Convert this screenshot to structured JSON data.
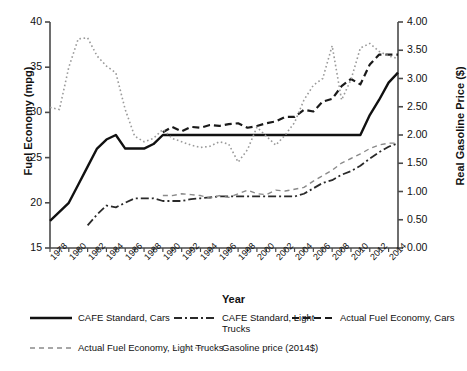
{
  "chart_data": {
    "type": "line",
    "title": "",
    "xlabel": "Year",
    "ylabel": "Fuel Economy (mpg)",
    "ylabel_right": "Real Gasoline Price ($)",
    "grid": false,
    "legend_position": "below",
    "xlim": [
      1978,
      2015
    ],
    "ylim": [
      15,
      40
    ],
    "ylim_right": [
      0.0,
      4.0
    ],
    "yticks": [
      "15",
      "20",
      "25",
      "30",
      "35",
      "40"
    ],
    "yticks_right": [
      "0.00",
      "0.50",
      "1.00",
      "1.50",
      "2.00",
      "2.50",
      "3.00",
      "3.50",
      "4.00"
    ],
    "xticks": [
      "1978",
      "1980",
      "1982",
      "1984",
      "1986",
      "1988",
      "1990",
      "1992",
      "1994",
      "1996",
      "1998",
      "2000",
      "2002",
      "2004",
      "2006",
      "2008",
      "2010",
      "2012",
      "2014"
    ],
    "x": [
      1978,
      1979,
      1980,
      1981,
      1982,
      1983,
      1984,
      1985,
      1986,
      1987,
      1988,
      1989,
      1990,
      1991,
      1992,
      1993,
      1994,
      1995,
      1996,
      1997,
      1998,
      1999,
      2000,
      2001,
      2002,
      2003,
      2004,
      2005,
      2006,
      2007,
      2008,
      2009,
      2010,
      2011,
      2012,
      2013,
      2014,
      2015
    ],
    "series": [
      {
        "name": "CAFE Standard, Cars",
        "axis": "left",
        "style": "solid",
        "values": [
          18.0,
          19.0,
          20.0,
          22.0,
          24.0,
          26.0,
          27.0,
          27.5,
          26.0,
          26.0,
          26.0,
          26.5,
          27.5,
          27.5,
          27.5,
          27.5,
          27.5,
          27.5,
          27.5,
          27.5,
          27.5,
          27.5,
          27.5,
          27.5,
          27.5,
          27.5,
          27.5,
          27.5,
          27.5,
          27.5,
          27.5,
          27.5,
          27.5,
          27.5,
          29.7,
          31.4,
          33.3,
          34.4
        ]
      },
      {
        "name": "CAFE Standard, Light Trucks",
        "axis": "left",
        "style": "dash-dot",
        "values": [
          null,
          null,
          null,
          null,
          17.5,
          18.7,
          19.7,
          19.5,
          20.0,
          20.5,
          20.5,
          20.5,
          20.2,
          20.2,
          20.2,
          20.4,
          20.5,
          20.6,
          20.7,
          20.7,
          20.7,
          20.7,
          20.7,
          20.7,
          20.7,
          20.7,
          20.7,
          21.0,
          21.6,
          22.2,
          22.5,
          23.1,
          23.5,
          24.1,
          24.9,
          25.6,
          26.2,
          26.6
        ]
      },
      {
        "name": "Actual Fuel Economy, Cars",
        "axis": "left",
        "style": "dash",
        "values": [
          null,
          null,
          null,
          null,
          null,
          null,
          null,
          null,
          null,
          null,
          null,
          null,
          27.8,
          28.4,
          27.9,
          28.4,
          28.3,
          28.6,
          28.5,
          28.7,
          28.8,
          28.3,
          28.5,
          28.8,
          29.0,
          29.5,
          29.5,
          30.3,
          30.1,
          31.2,
          31.5,
          32.9,
          33.7,
          33.1,
          35.3,
          36.4,
          36.4,
          36.4
        ]
      },
      {
        "name": "Actual Fuel Economy, Light Trucks",
        "axis": "left",
        "style": "fine-dash",
        "values": [
          null,
          null,
          null,
          null,
          null,
          null,
          null,
          null,
          null,
          null,
          null,
          null,
          20.8,
          20.8,
          21.0,
          20.9,
          20.8,
          20.5,
          20.8,
          20.6,
          21.0,
          21.4,
          21.0,
          20.9,
          21.4,
          21.3,
          21.5,
          21.7,
          22.4,
          23.0,
          23.6,
          24.4,
          24.9,
          25.4,
          26.0,
          26.4,
          26.6,
          26.6
        ]
      },
      {
        "name": "Gasoline price (2014$)",
        "axis": "right",
        "style": "dotted",
        "values": [
          2.49,
          2.45,
          3.2,
          3.7,
          3.72,
          3.4,
          3.22,
          3.1,
          2.45,
          1.98,
          1.88,
          1.94,
          2.1,
          1.94,
          1.88,
          1.82,
          1.78,
          1.8,
          1.88,
          1.84,
          1.52,
          1.74,
          2.14,
          1.98,
          1.82,
          2.0,
          2.22,
          2.62,
          2.88,
          3.0,
          3.58,
          2.62,
          2.98,
          3.54,
          3.62,
          3.48,
          3.4,
          3.35
        ]
      }
    ],
    "legend": [
      {
        "label": "CAFE Standard, Cars",
        "style": "solid"
      },
      {
        "label": "CAFE Standard, Light Trucks",
        "style": "dash-dot"
      },
      {
        "label": "Actual Fuel Economy, Cars",
        "style": "dash"
      },
      {
        "label": "Actual Fuel Economy, Light Trucks",
        "style": "fine-dash"
      },
      {
        "label": "Gasoline price (2014$)",
        "style": "dotted"
      }
    ],
    "colors": {
      "line": "#1a1a1a",
      "axis": "#4a4a4a",
      "dotted": "#7d7d7d"
    }
  }
}
